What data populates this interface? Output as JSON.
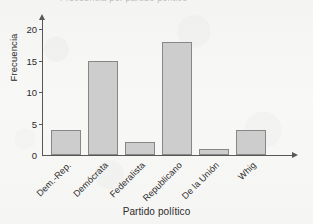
{
  "figure": {
    "cut_off_title": "Frecuencia por partido político",
    "background_color": "#f7f7f5",
    "bar_fill_color": "#cdcdcd",
    "bar_border_color": "#878787",
    "axis_color": "#585858"
  },
  "chart_data": {
    "type": "bar",
    "title": "",
    "xlabel": "Partido político",
    "ylabel": "Frecuencia",
    "categories": [
      "Dem.-Rep.",
      "Demócrata",
      "Federalista",
      "Republicano",
      "De la Unión",
      "Whig"
    ],
    "values": [
      4,
      15,
      2,
      18,
      1,
      4
    ],
    "ylim": [
      0,
      21
    ],
    "yticks": [
      0,
      5,
      10,
      15,
      20
    ],
    "ytick_labels": [
      "0",
      "5",
      "10",
      "15",
      "20"
    ],
    "grid": false,
    "legend": "none",
    "axis_arrows": true,
    "xtick_label_rotation": -45
  }
}
